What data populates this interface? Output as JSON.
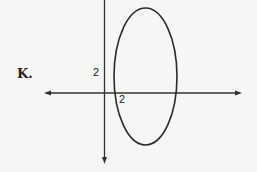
{
  "figure": {
    "option_label": "K.",
    "y_tick_label": "2",
    "x_tick_label": "2",
    "shape": "ellipse"
  }
}
